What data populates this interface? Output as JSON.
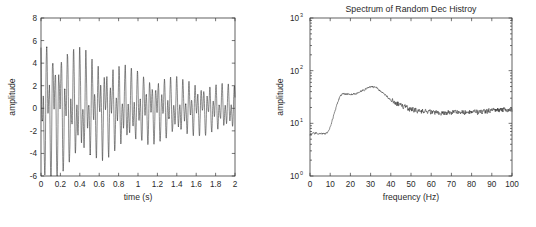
{
  "page": {
    "background": "#ffffff",
    "line_color": "#2b2b2b",
    "axis_color": "#3a3a3a"
  },
  "chart_data": [
    {
      "id": "random-dec-time-history",
      "type": "line",
      "title": "",
      "xlabel": "time (s)",
      "ylabel": "amplitude",
      "xlim": [
        0,
        2
      ],
      "ylim": [
        -6,
        8
      ],
      "xticks": [
        0,
        0.2,
        0.4,
        0.6,
        0.8,
        1,
        1.2,
        1.4,
        1.6,
        1.8,
        2
      ],
      "xticklabels": [
        "0",
        "0.2",
        "0.4",
        "0.6",
        "0.8",
        "1",
        "1.2",
        "1.4",
        "1.6",
        "1.8",
        "2"
      ],
      "yticks": [
        -6,
        -4,
        -2,
        0,
        2,
        4,
        6,
        8
      ],
      "yticklabels": [
        "-6",
        "-4",
        "-2",
        "0",
        "2",
        "4",
        "6",
        "8"
      ],
      "grid": false,
      "legend": null,
      "xscale": "linear",
      "yscale": "linear",
      "description": "Decaying random decrement response; beating of two modes near 15 Hz and 32 Hz with amplitude decaying from about +6.5/-6 to about +2/-2",
      "model": {
        "kind": "damped-two-mode-beat",
        "sample_rate": 1000,
        "duration": 2,
        "components": [
          {
            "freq": 15.0,
            "amp": 3.2,
            "decay": 1.15,
            "phase": 0.0
          },
          {
            "freq": 32.0,
            "amp": 3.0,
            "decay": 0.72,
            "phase": 1.1
          },
          {
            "freq": 78.0,
            "amp": 0.35,
            "decay": 1.5,
            "phase": 0.4
          }
        ],
        "noise_amp": 0.22,
        "floor": 0.62,
        "seed": 20240517
      }
    },
    {
      "id": "random-dec-spectrum",
      "type": "line",
      "title": "Spectrum of Random Dec Histroy",
      "xlabel": "frequency (Hz)",
      "ylabel": "amplitude",
      "xlim": [
        0,
        100
      ],
      "ylim": [
        1,
        1000
      ],
      "xticks": [
        0,
        10,
        20,
        30,
        40,
        50,
        60,
        70,
        80,
        90,
        100
      ],
      "xticklabels": [
        "0",
        "10",
        "20",
        "30",
        "40",
        "50",
        "60",
        "70",
        "80",
        "90",
        "100"
      ],
      "yticks": [
        1,
        10,
        100,
        1000
      ],
      "yticklabels": [
        "10",
        "10",
        "10",
        "10"
      ],
      "ytickexponents": [
        "0",
        "1",
        "2",
        "3"
      ],
      "grid": false,
      "legend": null,
      "xscale": "linear",
      "yscale": "log",
      "description": "Log-magnitude spectrum with dominant peaks at about 15 Hz (amplitude ~800) and 32 Hz (amplitude >1000, clipped), secondary peaks near 18 Hz (~50), 29 Hz (~35) and 78 Hz (~35), deep notch near 25 Hz (~2)",
      "peaks": [
        {
          "frequency": 15.0,
          "amplitude": 830
        },
        {
          "frequency": 18.2,
          "amplitude": 52
        },
        {
          "frequency": 29.0,
          "amplitude": 36
        },
        {
          "frequency": 32.2,
          "amplitude": 1200
        },
        {
          "frequency": 78.3,
          "amplitude": 36
        }
      ],
      "notches": [
        {
          "frequency": 25.2,
          "amplitude": 2.0
        },
        {
          "frequency": 20.8,
          "amplitude": 17
        }
      ],
      "model": {
        "kind": "modal-sum-log-spectrum",
        "points": 700,
        "modes": [
          {
            "freq": 15.0,
            "gain": 780,
            "q": 70
          },
          {
            "freq": 18.2,
            "gain": 48,
            "q": 90
          },
          {
            "freq": 29.0,
            "gain": 32,
            "q": 120
          },
          {
            "freq": 32.2,
            "gain": 1300,
            "q": 80
          },
          {
            "freq": 78.3,
            "gain": 34,
            "q": 220
          },
          {
            "freq": 79.6,
            "gain": 18,
            "q": 260
          }
        ],
        "baseline_low": 1.8,
        "ripple_amp": 0.09,
        "seed": 777
      }
    }
  ]
}
